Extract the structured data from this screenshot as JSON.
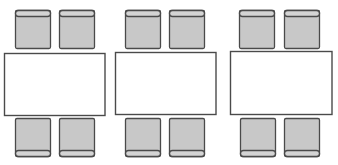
{
  "diagram": {
    "colors": {
      "background": "#ffffff",
      "table_fill": "#ffffff",
      "outline": "#4a4a4a",
      "chair_fill": "#c8c8c8",
      "chair_back_fill": "#d4d4d4"
    },
    "groups": [
      {
        "id": "table-group-1",
        "chairs_top": 2,
        "chairs_bottom": 2
      },
      {
        "id": "table-group-2",
        "chairs_top": 2,
        "chairs_bottom": 2
      },
      {
        "id": "table-group-3",
        "chairs_top": 2,
        "chairs_bottom": 2
      }
    ]
  }
}
